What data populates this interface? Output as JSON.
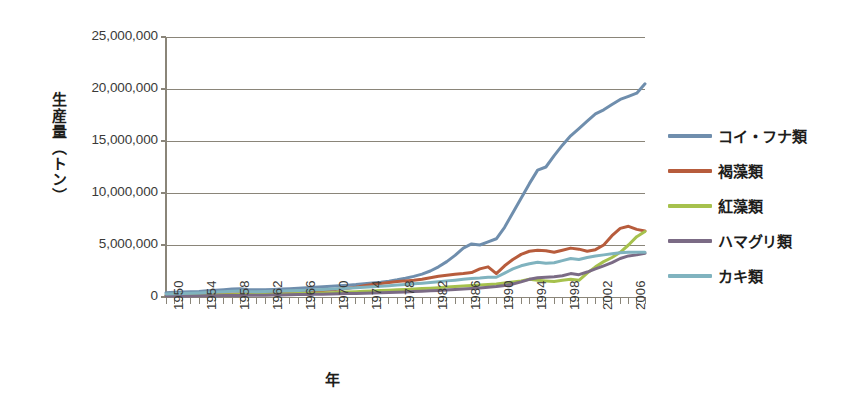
{
  "chart_data": {
    "type": "line",
    "title": "",
    "xlabel": "年",
    "ylabel": "生産量（トン）",
    "xlim": [
      1950,
      2008
    ],
    "ylim": [
      0,
      25000000
    ],
    "grid": true,
    "legend_position": "right",
    "y_ticks": [
      {
        "value": 0,
        "label": "0"
      },
      {
        "value": 5000000,
        "label": "5,000,000"
      },
      {
        "value": 10000000,
        "label": "10,000,000"
      },
      {
        "value": 15000000,
        "label": "15,000,000"
      },
      {
        "value": 20000000,
        "label": "20,000,000"
      },
      {
        "value": 25000000,
        "label": "25,000,000"
      }
    ],
    "x_ticks": [
      {
        "value": 1950,
        "label": "1950"
      },
      {
        "value": 1954,
        "label": "1954"
      },
      {
        "value": 1958,
        "label": "1958"
      },
      {
        "value": 1962,
        "label": "1962"
      },
      {
        "value": 1966,
        "label": "1966"
      },
      {
        "value": 1970,
        "label": "1970"
      },
      {
        "value": 1974,
        "label": "1974"
      },
      {
        "value": 1978,
        "label": "1978"
      },
      {
        "value": 1982,
        "label": "1982"
      },
      {
        "value": 1986,
        "label": "1986"
      },
      {
        "value": 1990,
        "label": "1990"
      },
      {
        "value": 1994,
        "label": "1994"
      },
      {
        "value": 1998,
        "label": "1998"
      },
      {
        "value": 2002,
        "label": "2002"
      },
      {
        "value": 2006,
        "label": "2006"
      }
    ],
    "x": [
      1950,
      1951,
      1952,
      1953,
      1954,
      1955,
      1956,
      1957,
      1958,
      1959,
      1960,
      1961,
      1962,
      1963,
      1964,
      1965,
      1966,
      1967,
      1968,
      1969,
      1970,
      1971,
      1972,
      1973,
      1974,
      1975,
      1976,
      1977,
      1978,
      1979,
      1980,
      1981,
      1982,
      1983,
      1984,
      1985,
      1986,
      1987,
      1988,
      1989,
      1990,
      1991,
      1992,
      1993,
      1994,
      1995,
      1996,
      1997,
      1998,
      1999,
      2000,
      2001,
      2002,
      2003,
      2004,
      2005,
      2006,
      2007,
      2008
    ],
    "series": [
      {
        "name": "コイ・フナ類",
        "color": "#6f8ead",
        "values": [
          420000,
          450000,
          470000,
          500000,
          540000,
          600000,
          650000,
          700000,
          760000,
          790000,
          700000,
          690000,
          700000,
          730000,
          760000,
          800000,
          840000,
          880000,
          930000,
          980000,
          1030000,
          1080000,
          1140000,
          1200000,
          1280000,
          1350000,
          1420000,
          1520000,
          1650000,
          1800000,
          1980000,
          2200000,
          2500000,
          2900000,
          3400000,
          4000000,
          4700000,
          5100000,
          5000000,
          5300000,
          5600000,
          6700000,
          8100000,
          9500000,
          10900000,
          12200000,
          12500000,
          13600000,
          14600000,
          15500000,
          16200000,
          16900000,
          17600000,
          18000000,
          18500000,
          19000000,
          19300000,
          19600000,
          20500000
        ]
      },
      {
        "name": "褐藻類",
        "color": "#b75c3c",
        "values": [
          170000,
          180000,
          190000,
          200000,
          220000,
          240000,
          260000,
          280000,
          300000,
          320000,
          340000,
          360000,
          380000,
          400000,
          430000,
          460000,
          500000,
          540000,
          580000,
          630000,
          680000,
          760000,
          850000,
          950000,
          1080000,
          1200000,
          1300000,
          1400000,
          1480000,
          1550000,
          1600000,
          1700000,
          1850000,
          2000000,
          2100000,
          2180000,
          2250000,
          2350000,
          2700000,
          2900000,
          2250000,
          3000000,
          3600000,
          4100000,
          4400000,
          4500000,
          4450000,
          4300000,
          4500000,
          4700000,
          4600000,
          4400000,
          4550000,
          5000000,
          5900000,
          6600000,
          6800000,
          6500000,
          6350000
        ]
      },
      {
        "name": "紅藻類",
        "color": "#a6c14d",
        "values": [
          130000,
          140000,
          145000,
          150000,
          160000,
          175000,
          190000,
          205000,
          220000,
          230000,
          240000,
          250000,
          265000,
          280000,
          295000,
          310000,
          330000,
          350000,
          370000,
          395000,
          420000,
          450000,
          480000,
          510000,
          545000,
          580000,
          615000,
          650000,
          690000,
          730000,
          770000,
          810000,
          850000,
          900000,
          950000,
          1000000,
          1050000,
          1100000,
          1150000,
          1200000,
          1250000,
          1350000,
          1450000,
          1550000,
          1700000,
          1600000,
          1550000,
          1500000,
          1600000,
          1700000,
          1600000,
          2300000,
          2900000,
          3400000,
          3800000,
          4300000,
          5000000,
          5800000,
          6300000
        ]
      },
      {
        "name": "ハマグリ類",
        "color": "#7b6b85",
        "values": [
          90000,
          95000,
          100000,
          105000,
          110000,
          118000,
          126000,
          134000,
          142000,
          150000,
          160000,
          170000,
          180000,
          192000,
          204000,
          216000,
          230000,
          244000,
          258000,
          274000,
          290000,
          308000,
          326000,
          346000,
          368000,
          390000,
          414000,
          438000,
          464000,
          492000,
          520000,
          555000,
          590000,
          630000,
          670000,
          715000,
          760000,
          810000,
          870000,
          930000,
          1000000,
          1100000,
          1250000,
          1450000,
          1700000,
          1850000,
          1900000,
          1950000,
          2050000,
          2250000,
          2150000,
          2400000,
          2700000,
          3000000,
          3300000,
          3700000,
          3950000,
          4050000,
          4200000
        ]
      },
      {
        "name": "カキ類",
        "color": "#80b3bf",
        "values": [
          300000,
          320000,
          340000,
          360000,
          390000,
          430000,
          470000,
          510000,
          560000,
          580000,
          520000,
          510000,
          520000,
          545000,
          570000,
          600000,
          630000,
          660000,
          690000,
          725000,
          760000,
          800000,
          840000,
          885000,
          930000,
          980000,
          1030000,
          1090000,
          1150000,
          1210000,
          1270000,
          1330000,
          1400000,
          1470000,
          1550000,
          1620000,
          1700000,
          1780000,
          1830000,
          1900000,
          1900000,
          2300000,
          2700000,
          3000000,
          3200000,
          3350000,
          3250000,
          3300000,
          3500000,
          3700000,
          3600000,
          3800000,
          3950000,
          4050000,
          4150000,
          4250000,
          4300000,
          4300000,
          4300000
        ]
      }
    ]
  },
  "legend": {
    "items": [
      {
        "label": "コイ・フナ類",
        "color": "#6f8ead"
      },
      {
        "label": "褐藻類",
        "color": "#b75c3c"
      },
      {
        "label": "紅藻類",
        "color": "#a6c14d"
      },
      {
        "label": "ハマグリ類",
        "color": "#7b6b85"
      },
      {
        "label": "カキ類",
        "color": "#80b3bf"
      }
    ]
  },
  "axes": {
    "y_title": "生産量（トン）",
    "x_title": "年"
  },
  "colors": {
    "background": "#ffffff",
    "gridline": "#8a8579",
    "axis": "#8a8579",
    "text": "#1d1d1b"
  }
}
